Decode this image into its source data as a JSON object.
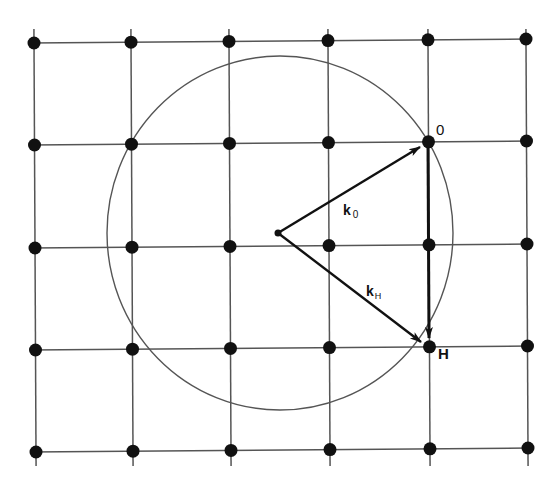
{
  "figure": {
    "lattice": {
      "columns": 6,
      "rows": 5,
      "point_color": "#111111",
      "line_color": "#555555"
    },
    "ewald_circle": {
      "color": "#555555"
    },
    "labels": {
      "origin": "0",
      "reflection": "H",
      "k0_main": "k",
      "k0_sub": "0",
      "kH_main": "k",
      "kH_sub": "H"
    },
    "vectors": [
      {
        "name": "k0",
        "from": "center",
        "to": "origin-point"
      },
      {
        "name": "kH",
        "from": "center",
        "to": "reflection-point"
      },
      {
        "name": "H",
        "from": "origin-point",
        "to": "reflection-point"
      }
    ]
  }
}
